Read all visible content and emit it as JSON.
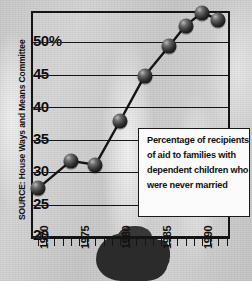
{
  "chart_data": {
    "type": "line",
    "title": "",
    "annotation": "Percentage of recipients of aid to families with dependent children who were never married",
    "annotation_lines": [
      "Percentage of recipients",
      "of aid to families with",
      "dependent children who",
      "were never married"
    ],
    "source": "SOURCE: House Ways and Means Committee",
    "xlabel": "",
    "ylabel": "",
    "xlim": [
      1969,
      1993
    ],
    "ylim": [
      20,
      53.5
    ],
    "grid": true,
    "legend": "none",
    "y_ticks": [
      "50%",
      "45",
      "40",
      "35",
      "30",
      "25",
      "20"
    ],
    "y_tick_values": [
      50,
      45,
      40,
      35,
      30,
      25,
      20
    ],
    "x_ticks": [
      "1970",
      "1975",
      "1980",
      "1985",
      "1990"
    ],
    "x_tick_values": [
      1970,
      1975,
      1980,
      1985,
      1990
    ],
    "x": [
      1970,
      1974,
      1977,
      1980,
      1983,
      1986,
      1988,
      1990,
      1992
    ],
    "values": [
      27.3,
      31.5,
      30.9,
      37.6,
      44.5,
      49.1,
      52.2,
      54.2,
      53.1
    ],
    "marker": "sphere",
    "marker_color": "#1a1a1a",
    "line_color": "#141414",
    "background_color": "#cfcfcf",
    "plot_border_color": "#141414"
  },
  "axis": {
    "y_labels": [
      {
        "text": "50%",
        "top": 33
      },
      {
        "text": "45",
        "top": 66
      },
      {
        "text": "40",
        "top": 99
      },
      {
        "text": "35",
        "top": 131
      },
      {
        "text": "30",
        "top": 163
      },
      {
        "text": "25",
        "top": 196
      },
      {
        "text": "20",
        "top": 227
      }
    ],
    "x_labels": [
      {
        "text": "1970",
        "left": 38
      },
      {
        "text": "1975",
        "left": 79
      },
      {
        "text": "1980",
        "left": 120
      },
      {
        "text": "1985",
        "left": 161
      },
      {
        "text": "1990",
        "left": 202
      }
    ]
  },
  "source_note": {
    "text": "SOURCE: House Ways and Means Committee"
  }
}
